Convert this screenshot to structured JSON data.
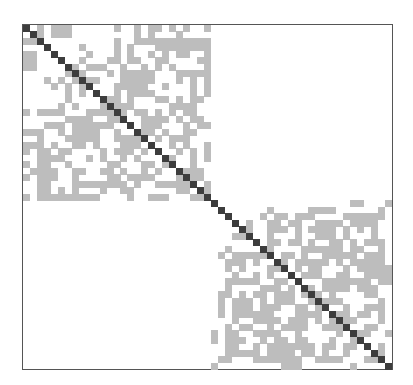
{
  "figure": {
    "type": "block-diagonal adjacency matrix",
    "size": 53,
    "blocks": [
      {
        "name": "block-1",
        "start": 0,
        "end": 26
      },
      {
        "name": "block-2",
        "start": 27,
        "end": 52
      }
    ],
    "colors": {
      "diagonal": "#3d3d3d",
      "off_diagonal": "#bdbdbd",
      "border": "#555555",
      "background": "#ffffff"
    },
    "offdiag_cells": [
      [
        0,
        4
      ],
      [
        0,
        5
      ],
      [
        0,
        18
      ],
      [
        0,
        19
      ],
      [
        0,
        23
      ],
      [
        0,
        26
      ],
      [
        1,
        4
      ],
      [
        1,
        5
      ],
      [
        1,
        6
      ],
      [
        1,
        18
      ],
      [
        1,
        22
      ],
      [
        2,
        0
      ],
      [
        2,
        1
      ],
      [
        2,
        13
      ],
      [
        2,
        18
      ],
      [
        2,
        19
      ],
      [
        2,
        21
      ],
      [
        2,
        22
      ],
      [
        2,
        23
      ],
      [
        2,
        24
      ],
      [
        2,
        25
      ],
      [
        2,
        26
      ],
      [
        3,
        8
      ],
      [
        3,
        13
      ],
      [
        3,
        19
      ],
      [
        3,
        21
      ],
      [
        3,
        22
      ],
      [
        3,
        23
      ],
      [
        3,
        24
      ],
      [
        3,
        25
      ],
      [
        3,
        26
      ],
      [
        4,
        1
      ],
      [
        4,
        9
      ],
      [
        4,
        13
      ],
      [
        4,
        18
      ],
      [
        4,
        22
      ],
      [
        4,
        26
      ],
      [
        5,
        1
      ],
      [
        5,
        8
      ],
      [
        5,
        12
      ],
      [
        5,
        13
      ],
      [
        5,
        19
      ],
      [
        5,
        25
      ],
      [
        5,
        26
      ],
      [
        6,
        0
      ],
      [
        6,
        1
      ],
      [
        6,
        9
      ],
      [
        6,
        10
      ],
      [
        6,
        11
      ],
      [
        6,
        14
      ],
      [
        6,
        17
      ],
      [
        6,
        19
      ],
      [
        6,
        21
      ],
      [
        6,
        26
      ],
      [
        7,
        6
      ],
      [
        7,
        15
      ],
      [
        7,
        16
      ],
      [
        7,
        17
      ],
      [
        7,
        18
      ],
      [
        7,
        24
      ],
      [
        7,
        25
      ],
      [
        7,
        26
      ],
      [
        8,
        7
      ],
      [
        8,
        9
      ],
      [
        8,
        16
      ],
      [
        8,
        17
      ],
      [
        8,
        18
      ],
      [
        9,
        8
      ],
      [
        9,
        15
      ],
      [
        9,
        16
      ],
      [
        9,
        17
      ],
      [
        9,
        26
      ],
      [
        10,
        8
      ],
      [
        10,
        13
      ],
      [
        10,
        16
      ],
      [
        10,
        17
      ],
      [
        11,
        12
      ],
      [
        11,
        13
      ],
      [
        11,
        19
      ],
      [
        11,
        20
      ],
      [
        11,
        22
      ],
      [
        11,
        24
      ],
      [
        11,
        25
      ],
      [
        12,
        7
      ],
      [
        12,
        12
      ],
      [
        12,
        13
      ],
      [
        12,
        14
      ],
      [
        12,
        21
      ],
      [
        12,
        22
      ],
      [
        12,
        23
      ],
      [
        12,
        24
      ],
      [
        13,
        0
      ],
      [
        13,
        2
      ],
      [
        13,
        4
      ],
      [
        13,
        5
      ],
      [
        13,
        9
      ],
      [
        13,
        10
      ],
      [
        13,
        11
      ],
      [
        13,
        19
      ],
      [
        14,
        7
      ],
      [
        14,
        8
      ],
      [
        14,
        9
      ],
      [
        14,
        12
      ],
      [
        14,
        13
      ],
      [
        14,
        17
      ],
      [
        14,
        18
      ],
      [
        14,
        19
      ],
      [
        15,
        3
      ],
      [
        15,
        4
      ],
      [
        15,
        5
      ],
      [
        15,
        8
      ],
      [
        15,
        10
      ],
      [
        15,
        11
      ],
      [
        15,
        12
      ],
      [
        15,
        17
      ],
      [
        15,
        23
      ],
      [
        15,
        25
      ],
      [
        15,
        26
      ],
      [
        16,
        0
      ],
      [
        16,
        1
      ],
      [
        16,
        2
      ],
      [
        16,
        5
      ],
      [
        16,
        13
      ],
      [
        16,
        17
      ],
      [
        16,
        24
      ],
      [
        17,
        2
      ],
      [
        17,
        6
      ],
      [
        17,
        10
      ],
      [
        17,
        13
      ],
      [
        17,
        14
      ],
      [
        17,
        17
      ],
      [
        17,
        21
      ],
      [
        17,
        22
      ],
      [
        18,
        2
      ],
      [
        18,
        10
      ],
      [
        18,
        14
      ],
      [
        18,
        15
      ],
      [
        18,
        16
      ],
      [
        18,
        21
      ],
      [
        18,
        26
      ],
      [
        19,
        2
      ],
      [
        19,
        13
      ],
      [
        19,
        15
      ],
      [
        19,
        17
      ],
      [
        19,
        22
      ],
      [
        19,
        26
      ],
      [
        20,
        2
      ],
      [
        20,
        3
      ],
      [
        20,
        4
      ],
      [
        20,
        5
      ],
      [
        20,
        9
      ],
      [
        20,
        14
      ],
      [
        20,
        16
      ],
      [
        20,
        21
      ],
      [
        20,
        24
      ],
      [
        21,
        0
      ],
      [
        21,
        2
      ],
      [
        21,
        13
      ],
      [
        21,
        18
      ],
      [
        21,
        20
      ],
      [
        22,
        2
      ],
      [
        22,
        3
      ],
      [
        22,
        7
      ],
      [
        22,
        8
      ],
      [
        22,
        14
      ],
      [
        22,
        19
      ],
      [
        22,
        23
      ],
      [
        22,
        25
      ],
      [
        23,
        2
      ],
      [
        23,
        3
      ],
      [
        23,
        4
      ],
      [
        23,
        7
      ],
      [
        23,
        12
      ],
      [
        23,
        13
      ],
      [
        23,
        16
      ],
      [
        23,
        17
      ],
      [
        23,
        18
      ],
      [
        23,
        24
      ],
      [
        23,
        25
      ],
      [
        24,
        2
      ],
      [
        24,
        3
      ],
      [
        24,
        7
      ],
      [
        24,
        8
      ],
      [
        24,
        9
      ],
      [
        24,
        10
      ],
      [
        24,
        13
      ],
      [
        24,
        14
      ],
      [
        24,
        19
      ],
      [
        24,
        20
      ],
      [
        24,
        21
      ],
      [
        24,
        22
      ],
      [
        25,
        2
      ],
      [
        25,
        3
      ],
      [
        25,
        7
      ],
      [
        25,
        14
      ],
      [
        25,
        15
      ],
      [
        25,
        26
      ],
      [
        26,
        3
      ],
      [
        26,
        7
      ],
      [
        26,
        8
      ],
      [
        26,
        9
      ],
      [
        26,
        10
      ],
      [
        26,
        20
      ],
      [
        26,
        24
      ],
      [
        27,
        47
      ],
      [
        27,
        48
      ],
      [
        27,
        52
      ],
      [
        28,
        35
      ],
      [
        28,
        41
      ],
      [
        28,
        42
      ],
      [
        28,
        43
      ],
      [
        28,
        44
      ],
      [
        28,
        51
      ],
      [
        29,
        39
      ],
      [
        29,
        40
      ],
      [
        29,
        41
      ],
      [
        29,
        46
      ],
      [
        29,
        47
      ],
      [
        29,
        48
      ],
      [
        29,
        49
      ],
      [
        29,
        50
      ],
      [
        29,
        51
      ],
      [
        30,
        38
      ],
      [
        30,
        39
      ],
      [
        30,
        44
      ],
      [
        30,
        45
      ],
      [
        30,
        47
      ],
      [
        30,
        49
      ],
      [
        30,
        50
      ],
      [
        31,
        39
      ],
      [
        31,
        41
      ],
      [
        31,
        48
      ],
      [
        31,
        50
      ],
      [
        32,
        30
      ],
      [
        32,
        31
      ],
      [
        32,
        32
      ],
      [
        32,
        39
      ],
      [
        32,
        42
      ],
      [
        32,
        43
      ],
      [
        32,
        46
      ],
      [
        32,
        50
      ],
      [
        33,
        38
      ],
      [
        33,
        44
      ],
      [
        33,
        45
      ],
      [
        33,
        47
      ],
      [
        33,
        51
      ],
      [
        34,
        29
      ],
      [
        34,
        34
      ],
      [
        34,
        43
      ],
      [
        34,
        44
      ],
      [
        34,
        45
      ],
      [
        34,
        48
      ],
      [
        35,
        30
      ],
      [
        35,
        31
      ],
      [
        35,
        32
      ],
      [
        35,
        33
      ],
      [
        35,
        34
      ],
      [
        35,
        37
      ],
      [
        35,
        38
      ],
      [
        35,
        45
      ],
      [
        35,
        46
      ],
      [
        35,
        49
      ],
      [
        35,
        50
      ],
      [
        35,
        51
      ],
      [
        36,
        29
      ],
      [
        36,
        30
      ],
      [
        36,
        31
      ],
      [
        36,
        33
      ],
      [
        36,
        41
      ],
      [
        36,
        42
      ],
      [
        36,
        43
      ],
      [
        36,
        48
      ],
      [
        36,
        49
      ],
      [
        36,
        50
      ],
      [
        37,
        29
      ],
      [
        37,
        31
      ],
      [
        37,
        35
      ],
      [
        37,
        36
      ],
      [
        37,
        37
      ],
      [
        37,
        41
      ],
      [
        37,
        48
      ],
      [
        37,
        50
      ],
      [
        37,
        51
      ],
      [
        37,
        52
      ],
      [
        38,
        33
      ],
      [
        38,
        40
      ],
      [
        38,
        41
      ],
      [
        38,
        42
      ],
      [
        38,
        46
      ],
      [
        38,
        51
      ],
      [
        39,
        29
      ],
      [
        39,
        33
      ],
      [
        39,
        36
      ],
      [
        39,
        37
      ],
      [
        39,
        43
      ],
      [
        39,
        44
      ],
      [
        39,
        45
      ],
      [
        39,
        49
      ],
      [
        39,
        51
      ],
      [
        40,
        29
      ],
      [
        40,
        34
      ],
      [
        40,
        35
      ],
      [
        40,
        36
      ],
      [
        40,
        44
      ],
      [
        40,
        45
      ],
      [
        40,
        46
      ],
      [
        40,
        48
      ],
      [
        40,
        49
      ],
      [
        40,
        50
      ],
      [
        41,
        29
      ],
      [
        41,
        33
      ],
      [
        41,
        34
      ],
      [
        41,
        40
      ],
      [
        41,
        41
      ],
      [
        41,
        42
      ],
      [
        41,
        44
      ],
      [
        41,
        49
      ],
      [
        41,
        50
      ],
      [
        42,
        30
      ],
      [
        42,
        31
      ],
      [
        42,
        34
      ],
      [
        42,
        37
      ],
      [
        42,
        43
      ],
      [
        42,
        44
      ],
      [
        42,
        45
      ],
      [
        43,
        30
      ],
      [
        43,
        31
      ],
      [
        43,
        32
      ],
      [
        43,
        35
      ],
      [
        43,
        40
      ],
      [
        43,
        50
      ],
      [
        43,
        51
      ],
      [
        44,
        30
      ],
      [
        44,
        31
      ],
      [
        44,
        32
      ],
      [
        44,
        35
      ],
      [
        44,
        40
      ],
      [
        44,
        41
      ],
      [
        44,
        42
      ],
      [
        44,
        51
      ],
      [
        45,
        30
      ],
      [
        45,
        36
      ],
      [
        45,
        38
      ],
      [
        45,
        39
      ],
      [
        45,
        44
      ],
      [
        45,
        51
      ],
      [
        46,
        31
      ],
      [
        46,
        32
      ],
      [
        46,
        37
      ],
      [
        46,
        38
      ],
      [
        46,
        39
      ],
      [
        46,
        40
      ],
      [
        46,
        43
      ],
      [
        46,
        44
      ],
      [
        46,
        45
      ],
      [
        47,
        29
      ],
      [
        47,
        33
      ],
      [
        47,
        34
      ],
      [
        47,
        35
      ],
      [
        47,
        36
      ],
      [
        47,
        39
      ],
      [
        47,
        45
      ],
      [
        47,
        48
      ],
      [
        48,
        30
      ],
      [
        48,
        34
      ],
      [
        48,
        39
      ],
      [
        48,
        40
      ],
      [
        48,
        44
      ],
      [
        48,
        47
      ],
      [
        49,
        33
      ],
      [
        49,
        37
      ],
      [
        49,
        38
      ],
      [
        49,
        41
      ],
      [
        49,
        43
      ],
      [
        49,
        44
      ],
      [
        49,
        46
      ],
      [
        49,
        47
      ],
      [
        50,
        29
      ],
      [
        50,
        30
      ],
      [
        50,
        33
      ],
      [
        50,
        36
      ],
      [
        50,
        38
      ],
      [
        50,
        46
      ],
      [
        50,
        51
      ],
      [
        51,
        34
      ],
      [
        51,
        36
      ],
      [
        51,
        37
      ],
      [
        51,
        38
      ],
      [
        51,
        42
      ],
      [
        51,
        45
      ],
      [
        51,
        49
      ],
      [
        52,
        37
      ],
      [
        52,
        38
      ],
      [
        52,
        39
      ],
      [
        52,
        47
      ]
    ]
  }
}
